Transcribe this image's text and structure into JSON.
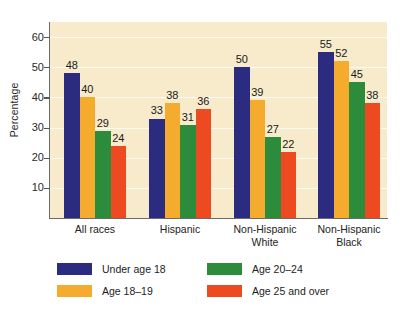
{
  "chart_data": {
    "type": "bar",
    "title": "",
    "xlabel": "",
    "ylabel": "Percentage",
    "ylim": [
      0,
      65
    ],
    "yticks": [
      10,
      20,
      30,
      40,
      50,
      60
    ],
    "ytick_labels": [
      "10",
      "20",
      "30",
      "40",
      "50",
      "60"
    ],
    "grid": true,
    "legend_position": "below",
    "categories": [
      "All races",
      "Hispanic",
      "Non-Hispanic\nWhite",
      "Non-Hispanic\nBlack"
    ],
    "series": [
      {
        "name": "Under age 18",
        "color": "#2b2b7f",
        "values": [
          48,
          33,
          50,
          55
        ]
      },
      {
        "name": "Age 18–19",
        "color": "#f5ac2e",
        "values": [
          40,
          38,
          39,
          52
        ]
      },
      {
        "name": "Age 20–24",
        "color": "#2d8b3c",
        "values": [
          29,
          31,
          27,
          45
        ]
      },
      {
        "name": "Age 25 and over",
        "color": "#ee4a22",
        "values": [
          24,
          36,
          22,
          38
        ]
      }
    ]
  },
  "colors": {
    "plot_background": "#f8ebcb",
    "page_background": "#ffffff",
    "axis": "#6b6b6b",
    "gridline": "#ffffff",
    "text": "#1c1c1c"
  }
}
